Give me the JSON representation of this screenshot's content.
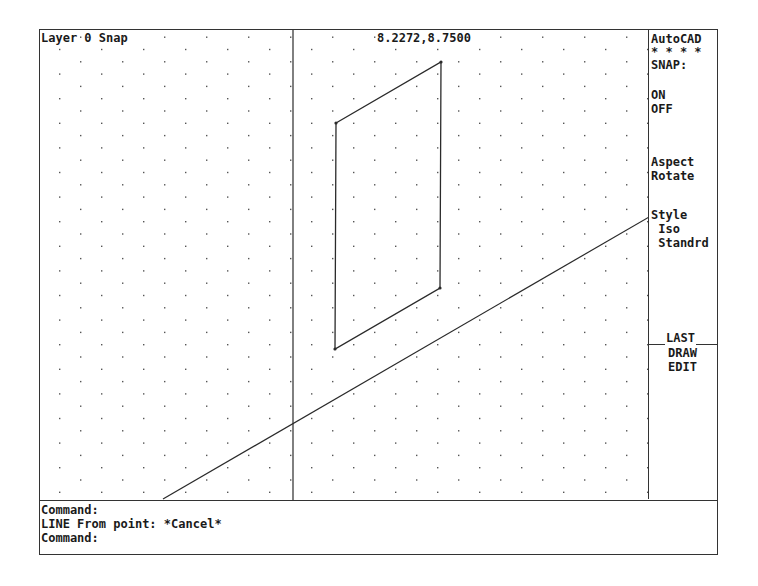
{
  "status": {
    "layer_text": "Layer 0 Snap",
    "coordinates": "8.2272,8.7500"
  },
  "menu": {
    "title": "AutoCAD",
    "stars": "* * * *",
    "heading": "SNAP:",
    "items": [
      {
        "label": "ON"
      },
      {
        "label": "OFF"
      },
      {
        "label": "Aspect"
      },
      {
        "label": "Rotate"
      },
      {
        "label": "Style"
      },
      {
        "label": " Iso"
      },
      {
        "label": " Standrd"
      }
    ],
    "last": "LAST",
    "draw": "DRAW",
    "edit": "EDIT"
  },
  "command": {
    "lines": [
      "Command:",
      "LINE From point: *Cancel*",
      "Command:"
    ]
  },
  "drawing": {
    "grid_style": "isometric",
    "grid_dx": 21,
    "grid_dy": 12.3,
    "lines_color": "#2a2a2a",
    "vertical_line_x": 293,
    "parallelogram": [
      [
        336,
        123
      ],
      [
        441,
        62
      ],
      [
        440,
        288
      ],
      [
        335,
        349
      ]
    ],
    "long_diagonal": [
      [
        163,
        499
      ],
      [
        649,
        217
      ]
    ]
  }
}
